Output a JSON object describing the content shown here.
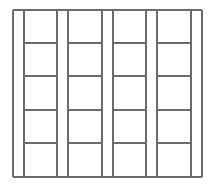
{
  "diagram": {
    "type": "grid-of-columns",
    "line_color": "#6a6a6a",
    "background": "#ffffff",
    "frame": {
      "left": 13,
      "top": 10,
      "right": 202,
      "bottom": 177
    },
    "columns": [
      {
        "id": "column-1",
        "x1": 24,
        "x2": 57
      },
      {
        "id": "column-2",
        "x1": 68,
        "x2": 102
      },
      {
        "id": "column-3",
        "x1": 113,
        "x2": 146
      },
      {
        "id": "column-4",
        "x1": 157,
        "x2": 191
      }
    ],
    "rows_y": [
      10,
      43,
      76,
      110,
      143,
      177
    ],
    "cells_per_column": 5
  }
}
